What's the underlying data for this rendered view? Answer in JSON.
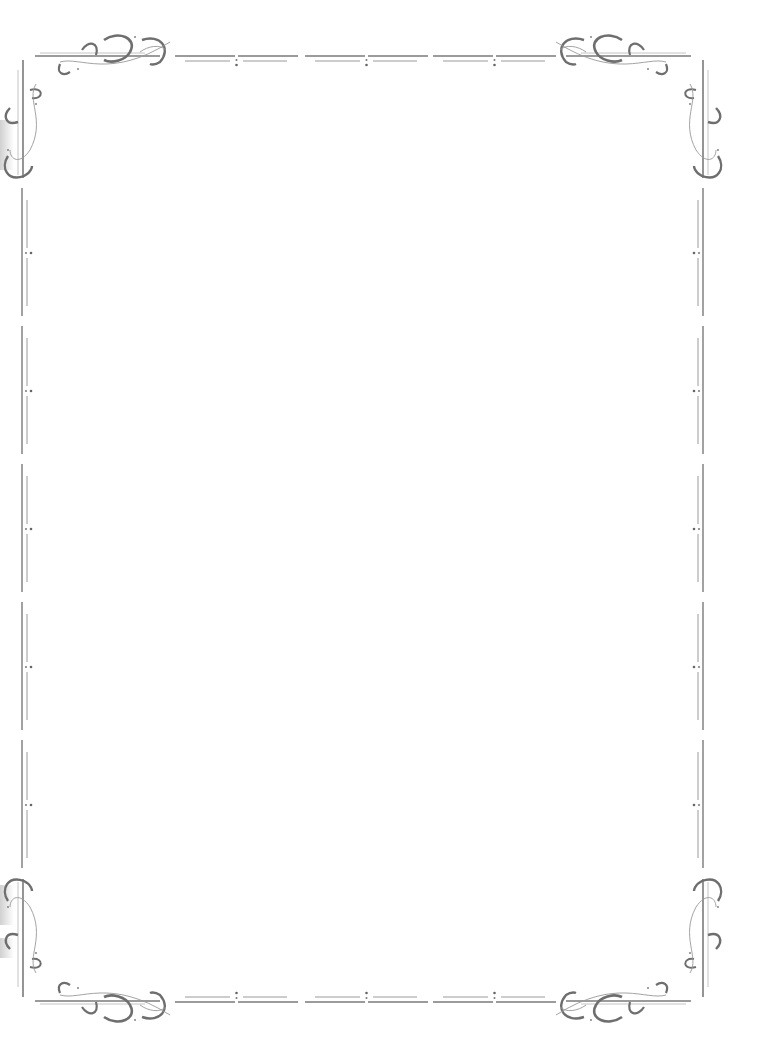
{
  "page": {
    "type": "decorative-border-frame",
    "content": ""
  },
  "border": {
    "stroke_color": "#6e6e6e",
    "light_stroke_color": "#a8a8a8",
    "background": "#ffffff",
    "corners": [
      "top-left-flourish",
      "top-right-flourish",
      "bottom-left-flourish",
      "bottom-right-flourish"
    ],
    "top_segments": 3,
    "bottom_segments": 3,
    "side_segments": 5
  }
}
